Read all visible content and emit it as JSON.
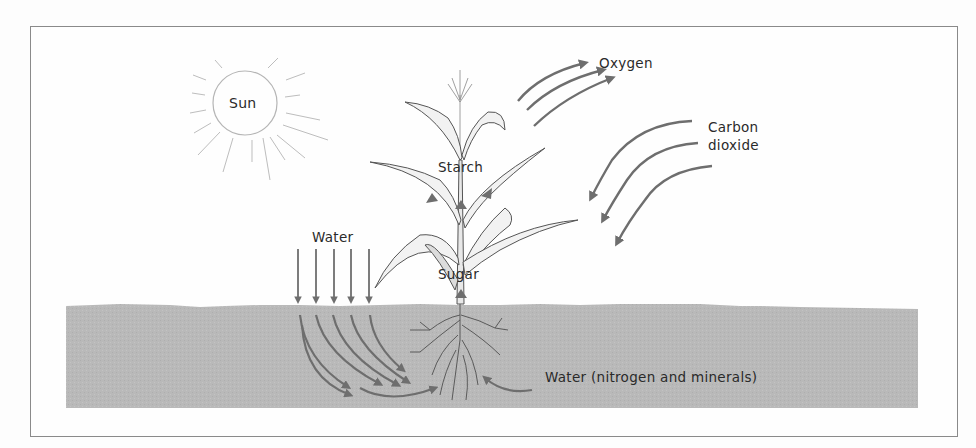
{
  "diagram": {
    "type": "photosynthesis-illustration",
    "labels": {
      "sun": "Sun",
      "oxygen": "Oxygen",
      "carbon_dioxide_line1": "Carbon",
      "carbon_dioxide_line2": "dioxide",
      "starch": "Starch",
      "water_rain": "Water",
      "sugar": "Sugar",
      "water_soil": "Water (nitrogen and minerals)"
    },
    "colors": {
      "frame": "#8a8a8a",
      "soil": "#b9b9b9",
      "arrow": "#6e6e6e",
      "text": "#2a2a2a",
      "plant_line": "#555555"
    },
    "arrows": {
      "oxygen_out": 3,
      "carbon_dioxide_in": 3,
      "water_rain_down": 5,
      "water_in_soil": 7,
      "water_from_right": 1,
      "transport_in_plant": 4
    }
  }
}
